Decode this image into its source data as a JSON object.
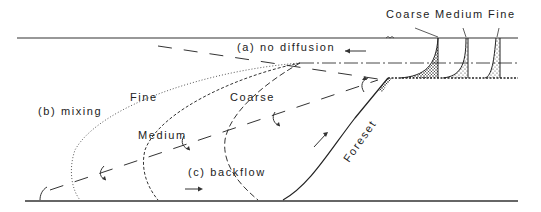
{
  "diagram": {
    "labels": {
      "top_coarse": "Coarse",
      "top_medium": "Medium",
      "top_fine": "Fine",
      "no_diffusion": "(a) no diffusion",
      "mixing": "(b) mixing",
      "backflow": "(c) backflow",
      "fine_curve": "Fine",
      "medium_curve": "Medium",
      "coarse_curve": "Coarse",
      "foreset": "Foreset"
    },
    "colors": {
      "ink": "#222222",
      "background": "#ffffff"
    }
  }
}
